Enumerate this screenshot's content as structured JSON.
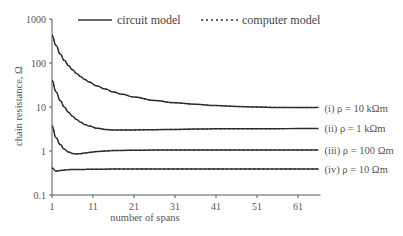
{
  "chart_data": {
    "type": "line",
    "title": "",
    "xlabel": "number of spans",
    "ylabel": "chain resistance, Ω",
    "yscale": "log",
    "xlim": [
      1,
      66
    ],
    "ylim": [
      0.1,
      1000
    ],
    "x_ticks": [
      "1",
      "11",
      "21",
      "31",
      "41",
      "51",
      "61"
    ],
    "y_ticks": [
      "0.1",
      "1",
      "10",
      "100",
      "1000"
    ],
    "grid": false,
    "legend": {
      "position": "top",
      "entries": [
        {
          "label": "circuit model",
          "style": "solid"
        },
        {
          "label": "computer model",
          "style": "dotted"
        }
      ]
    },
    "x": [
      1,
      2,
      3,
      4,
      5,
      6,
      7,
      8,
      9,
      10,
      12,
      14,
      16,
      18,
      21,
      26,
      31,
      36,
      41,
      46,
      51,
      56,
      61,
      66
    ],
    "series": [
      {
        "name": "(i) ρ = 10 kΩm",
        "label": "(i) ρ = 10 kΩm",
        "values": [
          430,
          250,
          160,
          115,
          88,
          70,
          58,
          49,
          42,
          37,
          30,
          25.5,
          22,
          19.5,
          16.8,
          14,
          12.5,
          11.5,
          10.8,
          10.3,
          10.0,
          9.8,
          9.7,
          9.7
        ]
      },
      {
        "name": "(ii) ρ = 1 kΩm",
        "label": "(ii) ρ = 1 kΩm",
        "values": [
          40,
          22,
          14,
          10,
          7.6,
          6.2,
          5.2,
          4.5,
          4.0,
          3.7,
          3.3,
          3.1,
          3.0,
          3.0,
          3.0,
          3.05,
          3.1,
          3.15,
          3.2,
          3.2,
          3.2,
          3.2,
          3.25,
          3.25
        ]
      },
      {
        "name": "(iii) ρ = 100 Ωm",
        "label": "(iii) ρ = 100 Ωm",
        "values": [
          3.7,
          2.0,
          1.4,
          1.1,
          0.95,
          0.88,
          0.86,
          0.87,
          0.9,
          0.93,
          0.97,
          1.0,
          1.02,
          1.03,
          1.04,
          1.05,
          1.05,
          1.06,
          1.06,
          1.06,
          1.06,
          1.06,
          1.06,
          1.06
        ]
      },
      {
        "name": "(iv) ρ = 10 Ωm",
        "label": "(iv) ρ = 10 Ωm",
        "values": [
          0.41,
          0.35,
          0.36,
          0.37,
          0.375,
          0.38,
          0.38,
          0.38,
          0.38,
          0.385,
          0.385,
          0.385,
          0.39,
          0.39,
          0.39,
          0.39,
          0.39,
          0.39,
          0.39,
          0.39,
          0.39,
          0.39,
          0.39,
          0.39
        ]
      }
    ]
  }
}
